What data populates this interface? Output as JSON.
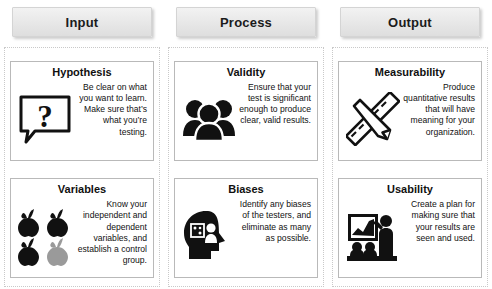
{
  "headers": [
    {
      "label": "Input",
      "name": "input"
    },
    {
      "label": "Process",
      "name": "process"
    },
    {
      "label": "Output",
      "name": "output"
    }
  ],
  "cards": [
    {
      "title": "Hypothesis",
      "text": "Be clear on what you want to learn.  Make sure that’s what you’re testing.",
      "icon": "speech-bubble-question-icon"
    },
    {
      "title": "Validity",
      "text": "Ensure that your test is significant enough to produce clear, valid results.",
      "icon": "people-group-icon"
    },
    {
      "title": "Measurability",
      "text": "Produce quantitative results that will have meaning for your organization.",
      "icon": "ruler-pencil-icon"
    },
    {
      "title": "Variables",
      "text": "Know your independent and dependent variables, and establish a control group.",
      "icon": "apples-icon"
    },
    {
      "title": "Biases",
      "text": "Identify any biases of the testers, and eliminate as many as possible.",
      "icon": "head-dice-icon"
    },
    {
      "title": "Usability",
      "text": "Create a plan for making sure that your results are seen and used.",
      "icon": "presentation-icon"
    }
  ],
  "colors": {
    "header_chip_top": "#f2f2f2",
    "header_chip_bottom": "#dedede",
    "card_border": "#b9b9b9",
    "column_dots": "#c9c9c9",
    "icon_black": "#111111",
    "icon_gray": "#9a9a9a",
    "text": "#111111",
    "background": "#ffffff"
  }
}
